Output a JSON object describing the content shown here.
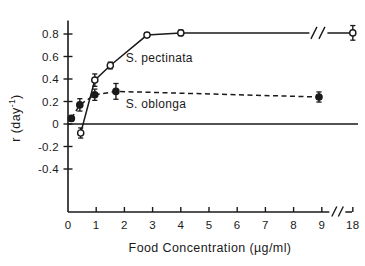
{
  "chart_data": {
    "type": "line",
    "title": "",
    "subtitle": "",
    "xlabel": "Food  Concentration  (µg/ml)",
    "ylabel": "r  (day",
    "ylabel_exponent": "-1",
    "ylabel_suffix": ")",
    "xlim": [
      0,
      9.9
    ],
    "ylim": [
      -0.55,
      0.95
    ],
    "grid": false,
    "legend_position": "inline-annotation",
    "axis_break_x": {
      "present": true,
      "after_tick": "9",
      "resumes_at_tick": "18"
    },
    "axis_break_series": {
      "present": true,
      "series": "S. pectinata",
      "note": "double-slash break in solid curve before final point"
    },
    "x_ticks": [
      "0",
      "1",
      "2",
      "3",
      "4",
      "5",
      "6",
      "7",
      "8",
      "9",
      "18"
    ],
    "x_tick_values": [
      0,
      1,
      2,
      3,
      4,
      5,
      6,
      7,
      8,
      9,
      10.1
    ],
    "y_ticks": [
      "0.8",
      "0.6",
      "0.4",
      "0.2",
      "0",
      "-0.2",
      "-0.4"
    ],
    "y_tick_values": [
      0.8,
      0.6,
      0.4,
      0.2,
      0,
      -0.2,
      -0.4
    ],
    "series": [
      {
        "name": "S. pectinata",
        "marker": "open-circle",
        "line_style": "solid",
        "color": "#1a1a1a",
        "x": [
          0.45,
          0.95,
          1.5,
          2.8,
          4.0,
          10.1
        ],
        "y": [
          -0.08,
          0.39,
          0.52,
          0.79,
          0.81,
          0.81
        ],
        "yerr": [
          0.045,
          0.055,
          0.03,
          0.02,
          0.025,
          0.065
        ]
      },
      {
        "name": "S. oblonga",
        "marker": "filled-circle",
        "line_style": "dashed",
        "color": "#1a1a1a",
        "x": [
          0.12,
          0.42,
          0.95,
          1.7,
          8.9
        ],
        "y": [
          0.05,
          0.17,
          0.26,
          0.29,
          0.24
        ],
        "yerr": [
          0.025,
          0.055,
          0.05,
          0.07,
          0.045
        ]
      }
    ],
    "annotations": [
      {
        "text": "S. pectinata",
        "x": 2.05,
        "y": 0.555
      },
      {
        "text": "S. oblonga",
        "x": 2.05,
        "y": 0.145
      }
    ]
  },
  "figure": {
    "background_color": "#ffffff",
    "ink_color": "#1a1a1a"
  }
}
